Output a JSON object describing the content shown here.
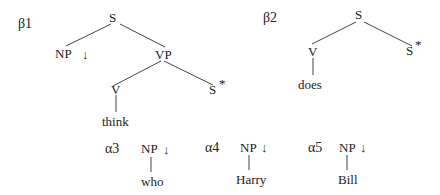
{
  "trees": {
    "beta1": {
      "name": "β1",
      "root": "S",
      "np": "NP",
      "np_mark": "↓",
      "vp": "VP",
      "v": "V",
      "s_foot": "S",
      "foot_mark": "*",
      "anchor": "think"
    },
    "beta2": {
      "name": "β2",
      "root": "S",
      "v": "V",
      "s_foot": "S",
      "foot_mark": "*",
      "anchor": "does"
    },
    "alpha3": {
      "name": "α3",
      "root": "NP",
      "mark": "↓",
      "anchor": "who"
    },
    "alpha4": {
      "name": "α4",
      "root": "NP",
      "mark": "↓",
      "anchor": "Harry"
    },
    "alpha5": {
      "name": "α5",
      "root": "NP",
      "mark": "↓",
      "anchor": "Bill"
    }
  }
}
